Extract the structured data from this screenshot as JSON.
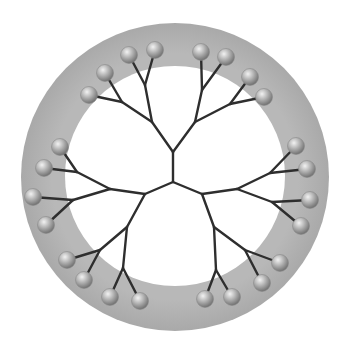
{
  "colors": {
    "outer_shell": "#b4b4b4",
    "outer_shell_edge": "#a6a6a6",
    "inner_core": "#ffffff",
    "bonds": "#2e2e2e",
    "terminal_group_light": "#f2f2f2",
    "terminal_group_dark": "#6e6e6e",
    "background": "#ffffff"
  },
  "shell": {
    "outer": {
      "cx": 175,
      "cy": 177,
      "r": 154
    },
    "inner": {
      "cx": 175,
      "cy": 176,
      "r": 110
    }
  },
  "core": {
    "x": 173,
    "y": 182
  },
  "branches": [
    {
      "name": "top",
      "gen1": {
        "x": 173,
        "y": 152
      },
      "gen2": [
        {
          "x": 152,
          "y": 122,
          "gen3": [
            {
              "x": 122,
              "y": 102,
              "leaves": [
                {
                  "x": 89,
                  "y": 95
                },
                {
                  "x": 105,
                  "y": 73
                }
              ]
            },
            {
              "x": 145,
              "y": 85,
              "leaves": [
                {
                  "x": 129,
                  "y": 55
                },
                {
                  "x": 155,
                  "y": 50
                }
              ]
            }
          ]
        },
        {
          "x": 195,
          "y": 122,
          "gen3": [
            {
              "x": 202,
              "y": 90,
              "leaves": [
                {
                  "x": 201,
                  "y": 52
                },
                {
                  "x": 226,
                  "y": 57
                }
              ]
            },
            {
              "x": 230,
              "y": 104,
              "leaves": [
                {
                  "x": 250,
                  "y": 77
                },
                {
                  "x": 264,
                  "y": 97
                }
              ]
            }
          ]
        }
      ]
    },
    {
      "name": "left",
      "gen1": {
        "x": 145,
        "y": 194
      },
      "gen2": [
        {
          "x": 110,
          "y": 189,
          "gen3": [
            {
              "x": 77,
              "y": 172,
              "leaves": [
                {
                  "x": 60,
                  "y": 147
                },
                {
                  "x": 44,
                  "y": 168
                }
              ]
            },
            {
              "x": 73,
              "y": 200,
              "leaves": [
                {
                  "x": 33,
                  "y": 197
                },
                {
                  "x": 46,
                  "y": 225
                }
              ]
            }
          ]
        },
        {
          "x": 127,
          "y": 227,
          "gen3": [
            {
              "x": 100,
              "y": 250,
              "leaves": [
                {
                  "x": 67,
                  "y": 260
                },
                {
                  "x": 84,
                  "y": 280
                }
              ]
            },
            {
              "x": 123,
              "y": 268,
              "leaves": [
                {
                  "x": 110,
                  "y": 297
                },
                {
                  "x": 140,
                  "y": 301
                }
              ]
            }
          ]
        }
      ]
    },
    {
      "name": "right",
      "gen1": {
        "x": 202,
        "y": 194
      },
      "gen2": [
        {
          "x": 237,
          "y": 189,
          "gen3": [
            {
              "x": 270,
              "y": 173,
              "leaves": [
                {
                  "x": 296,
                  "y": 146
                },
                {
                  "x": 307,
                  "y": 169
                }
              ]
            },
            {
              "x": 272,
              "y": 202,
              "leaves": [
                {
                  "x": 310,
                  "y": 200
                },
                {
                  "x": 301,
                  "y": 226
                }
              ]
            }
          ]
        },
        {
          "x": 214,
          "y": 227,
          "gen3": [
            {
              "x": 245,
              "y": 250,
              "leaves": [
                {
                  "x": 280,
                  "y": 263
                },
                {
                  "x": 262,
                  "y": 283
                }
              ]
            },
            {
              "x": 216,
              "y": 270,
              "leaves": [
                {
                  "x": 205,
                  "y": 299
                },
                {
                  "x": 232,
                  "y": 297
                }
              ]
            }
          ]
        }
      ]
    }
  ],
  "terminal_group_radius": 8.5,
  "terminal_group_count": 24
}
